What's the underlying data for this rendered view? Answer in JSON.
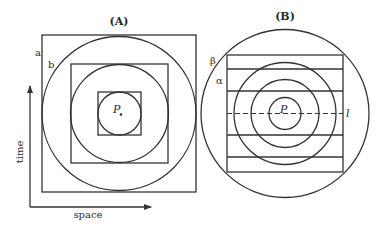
{
  "panels": {
    "a": {
      "title": "(A)",
      "label_outer": "a",
      "label_inner": "b",
      "point_label": "P",
      "y_axis_label": "time",
      "x_axis_label": "space"
    },
    "b": {
      "title": "(B)",
      "label_beta": "β",
      "label_alpha": "α",
      "point_label": "P",
      "line_label": "l"
    }
  },
  "colors": {
    "stroke": "#333333",
    "background": "#ffffff"
  }
}
